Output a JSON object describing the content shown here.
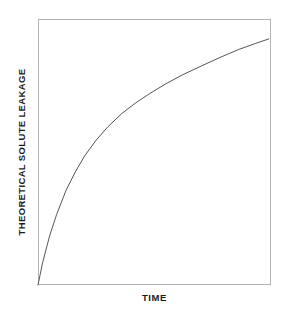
{
  "figure": {
    "background_color": "#ffffff",
    "frame_color": "#b4b4b4",
    "curve_color": "#555555",
    "text_color": "#1a1a1a"
  },
  "chart_data": {
    "type": "line",
    "title": "",
    "subtitle": "",
    "xlabel": "TIME",
    "ylabel": "THEORETICAL SOLUTE LEAKAGE",
    "xlim": [
      0,
      1
    ],
    "ylim": [
      0,
      1
    ],
    "xticks": [],
    "yticks": [],
    "xticklabels": [],
    "yticklabels": [],
    "grid": false,
    "legend": false,
    "legend_position": "none",
    "annotations": [],
    "series": [
      {
        "name": "Theoretical solute leakage",
        "shape": "concave-down monotonic increasing (logarithmic / square-root like)",
        "line_color": "#555555",
        "line_width": 1,
        "marker": "none",
        "x": [
          0.0,
          0.02,
          0.05,
          0.08,
          0.12,
          0.16,
          0.2,
          0.25,
          0.3,
          0.36,
          0.42,
          0.48,
          0.55,
          0.62,
          0.7,
          0.78,
          0.86,
          0.93,
          0.99
        ],
        "y": [
          0.0,
          0.085,
          0.185,
          0.265,
          0.355,
          0.425,
          0.485,
          0.545,
          0.595,
          0.645,
          0.685,
          0.72,
          0.757,
          0.79,
          0.823,
          0.855,
          0.885,
          0.907,
          0.925
        ]
      }
    ]
  },
  "axis_titles": {
    "x": "TIME",
    "y": "THEORETICAL SOLUTE LEAKAGE"
  }
}
